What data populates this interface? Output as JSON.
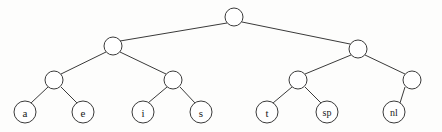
{
  "figure": {
    "kind": "binary-tree-diagram",
    "width": 442,
    "height": 132,
    "background_color": "#fdfdfc",
    "stroke_color": "#3a3a3a",
    "node_fill_color": "#ffffff",
    "text_color": "#1a1a1a"
  },
  "nodes": {
    "root": {
      "id": "root",
      "label": "",
      "cx": 234,
      "cy": 17,
      "r": 9,
      "type": "internal"
    },
    "left": {
      "id": "left",
      "label": "",
      "cx": 113,
      "cy": 46,
      "r": 9,
      "type": "internal"
    },
    "right": {
      "id": "right",
      "label": "",
      "cx": 358,
      "cy": 49,
      "r": 9,
      "type": "internal"
    },
    "left_left": {
      "id": "left_left",
      "label": "",
      "cx": 54,
      "cy": 80,
      "r": 9,
      "type": "internal"
    },
    "left_right": {
      "id": "left_right",
      "label": "",
      "cx": 173,
      "cy": 80,
      "r": 9,
      "type": "internal"
    },
    "right_left": {
      "id": "right_left",
      "label": "",
      "cx": 298,
      "cy": 80,
      "r": 9,
      "type": "internal"
    },
    "right_right": {
      "id": "right_right",
      "label": "",
      "cx": 412,
      "cy": 80,
      "r": 9,
      "type": "internal"
    },
    "leaf_a": {
      "id": "leaf_a",
      "label": "a",
      "cx": 25,
      "cy": 112,
      "r": 11,
      "type": "leaf"
    },
    "leaf_e": {
      "id": "leaf_e",
      "label": "e",
      "cx": 83,
      "cy": 112,
      "r": 11,
      "type": "leaf"
    },
    "leaf_i": {
      "id": "leaf_i",
      "label": "i",
      "cx": 143,
      "cy": 112,
      "r": 11,
      "type": "leaf"
    },
    "leaf_s": {
      "id": "leaf_s",
      "label": "s",
      "cx": 201,
      "cy": 112,
      "r": 11,
      "type": "leaf"
    },
    "leaf_t": {
      "id": "leaf_t",
      "label": "t",
      "cx": 267,
      "cy": 112,
      "r": 11,
      "type": "leaf"
    },
    "leaf_sp": {
      "id": "leaf_sp",
      "label": "sp",
      "cx": 327,
      "cy": 112,
      "r": 11,
      "type": "leaf"
    },
    "leaf_nl": {
      "id": "leaf_nl",
      "label": "nl",
      "cx": 394,
      "cy": 112,
      "r": 11,
      "type": "leaf"
    }
  },
  "edges": [
    {
      "from": "root",
      "to": "left",
      "x1": 227,
      "y1": 23,
      "x2": 120,
      "y2": 41
    },
    {
      "from": "root",
      "to": "right",
      "x1": 242,
      "y1": 22,
      "x2": 350,
      "y2": 44
    },
    {
      "from": "left",
      "to": "left_left",
      "x1": 106,
      "y1": 52,
      "x2": 61,
      "y2": 74
    },
    {
      "from": "left",
      "to": "left_right",
      "x1": 120,
      "y1": 52,
      "x2": 166,
      "y2": 74
    },
    {
      "from": "right",
      "to": "right_left",
      "x1": 351,
      "y1": 55,
      "x2": 305,
      "y2": 74
    },
    {
      "from": "right",
      "to": "right_right",
      "x1": 365,
      "y1": 55,
      "x2": 405,
      "y2": 74
    },
    {
      "from": "left_left",
      "to": "leaf_a",
      "x1": 48,
      "y1": 87,
      "x2": 31,
      "y2": 103
    },
    {
      "from": "left_left",
      "to": "leaf_e",
      "x1": 61,
      "y1": 87,
      "x2": 77,
      "y2": 103
    },
    {
      "from": "left_right",
      "to": "leaf_i",
      "x1": 167,
      "y1": 87,
      "x2": 148,
      "y2": 103
    },
    {
      "from": "left_right",
      "to": "leaf_s",
      "x1": 180,
      "y1": 87,
      "x2": 195,
      "y2": 103
    },
    {
      "from": "right_left",
      "to": "leaf_t",
      "x1": 292,
      "y1": 87,
      "x2": 273,
      "y2": 103
    },
    {
      "from": "right_left",
      "to": "leaf_sp",
      "x1": 305,
      "y1": 87,
      "x2": 321,
      "y2": 103
    },
    {
      "from": "right_right",
      "to": "leaf_nl",
      "x1": 405,
      "y1": 87,
      "x2": 400,
      "y2": 103
    }
  ]
}
